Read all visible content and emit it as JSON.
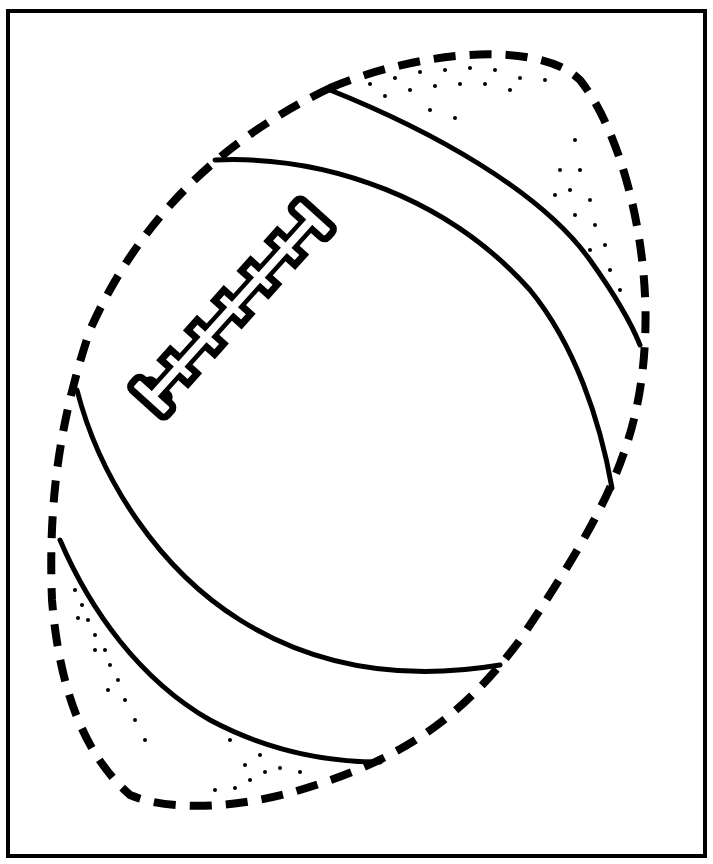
{
  "page": {
    "colors": {
      "ink": "#000000",
      "paper": "#ffffff"
    }
  }
}
